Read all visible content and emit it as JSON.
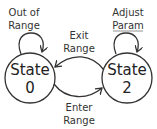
{
  "diagram": {
    "type": "state-machine",
    "colors": {
      "stroke": "#333333",
      "text": "#333333",
      "background": "#ffffff"
    },
    "states": [
      {
        "id": "s0",
        "line1": "State",
        "line2": "0"
      },
      {
        "id": "s2",
        "line1": "State",
        "line2": "2"
      }
    ],
    "transitions": [
      {
        "from": "s0",
        "to": "s0",
        "line1": "Out of",
        "line2": "Range"
      },
      {
        "from": "s2",
        "to": "s2",
        "line1": "Adjust",
        "line2": "Param"
      },
      {
        "from": "s2",
        "to": "s0",
        "line1": "Exit",
        "line2": "Range"
      },
      {
        "from": "s0",
        "to": "s2",
        "line1": "Enter",
        "line2": "Range"
      }
    ]
  }
}
